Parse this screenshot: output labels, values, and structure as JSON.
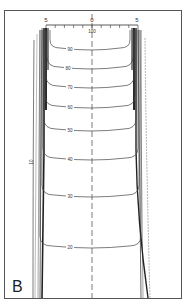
{
  "chart_data": {
    "type": "contour",
    "panel_label": "B",
    "title": "",
    "xlabel": "",
    "ylabel": "",
    "scale": {
      "ticks": [
        "5",
        "0",
        "5"
      ],
      "tick_count": 11,
      "center_value_label": "100"
    },
    "contour_levels": [
      90,
      80,
      70,
      60,
      50,
      40,
      30,
      20,
      10
    ],
    "contours": [
      {
        "level": "90",
        "label": "90",
        "label_x": 70,
        "y_bottom": 50,
        "y_top": 30,
        "x_left": 50,
        "x_right": 130
      },
      {
        "level": "80",
        "label": "80",
        "label_x": 68,
        "y_bottom": 69,
        "y_top": 30,
        "x_left": 47,
        "x_right": 133
      },
      {
        "level": "70",
        "label": "70",
        "label_x": 70,
        "y_bottom": 88,
        "y_top": 30,
        "x_left": 46,
        "x_right": 134
      },
      {
        "level": "60",
        "label": "60",
        "label_x": 70,
        "y_bottom": 108,
        "y_top": 30,
        "x_left": 45,
        "x_right": 135
      },
      {
        "level": "50",
        "label": "50",
        "label_x": 70,
        "y_bottom": 131,
        "y_top": 30,
        "x_left": 44,
        "x_right": 136
      },
      {
        "level": "40",
        "label": "40",
        "label_x": 70,
        "y_bottom": 160,
        "y_top": 30,
        "x_left": 43,
        "x_right": 138
      },
      {
        "level": "30",
        "label": "30",
        "label_x": 70,
        "y_bottom": 197,
        "y_top": 30,
        "x_left": 42,
        "x_right": 139
      },
      {
        "level": "20",
        "label": "20",
        "label_x": 70,
        "y_bottom": 248,
        "y_top": 30,
        "x_left": 40,
        "x_right": 141
      }
    ],
    "side_label": {
      "label": "10",
      "x": 33,
      "y": 162
    },
    "grid": false,
    "legend": "none",
    "colors": {
      "line": "#444444",
      "frame": "#555555",
      "background": "#ffffff"
    }
  }
}
